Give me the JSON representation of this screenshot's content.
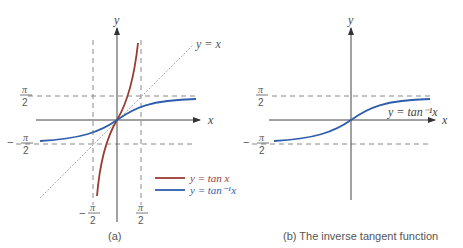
{
  "panel_a": {
    "caption": "(a)",
    "axis_x": "x",
    "axis_y": "y",
    "diag_label": "y = x",
    "pi_top": "π",
    "two": "2",
    "minus": "−",
    "legend": [
      {
        "label": "y = tan x",
        "color": "#9a3b33"
      },
      {
        "label": "y = tan⁻¹x",
        "color": "#2f5dab"
      }
    ]
  },
  "panel_b": {
    "caption": "(b)  The inverse tangent function",
    "axis_x": "x",
    "axis_y": "y",
    "curve_label": "y = tan⁻¹x",
    "pi_top": "π",
    "two": "2",
    "minus": "−"
  },
  "colors": {
    "tan": "#9a3b33",
    "arctan": "#2f5dab",
    "axis": "#555555",
    "dashed": "#8a8a8a"
  }
}
